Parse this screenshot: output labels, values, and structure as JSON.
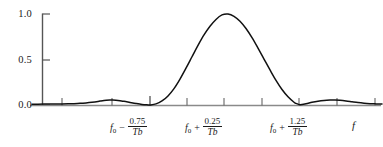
{
  "chart_data": {
    "type": "line",
    "title": "",
    "subtitle": "",
    "xlabel": "f",
    "ylabel": "",
    "ylim": [
      0.0,
      1.0
    ],
    "grid": false,
    "legend": null,
    "y_ticks": [
      "1.0",
      "0.5",
      "0.0"
    ],
    "y_tick_values": [
      1.0,
      0.5,
      0.0
    ],
    "x_tick_count": 8,
    "x_tick_labels": [
      {
        "id": "tick-minus-0p75",
        "base": "f",
        "base_sub": "0",
        "operator": "−",
        "numerator": "0.75",
        "denominator": "T",
        "denominator_sub": "b"
      },
      {
        "id": "tick-plus-0p25",
        "base": "f",
        "base_sub": "0",
        "operator": "+",
        "numerator": "0.25",
        "denominator": "T",
        "denominator_sub": "b"
      },
      {
        "id": "tick-plus-1p25",
        "base": "f",
        "base_sub": "0",
        "operator": "+",
        "numerator": "1.25",
        "denominator": "T",
        "denominator_sub": "b"
      }
    ],
    "series": [
      {
        "name": "spectrum",
        "color": "#111111",
        "x": [
          32,
          38,
          44,
          50,
          56,
          62,
          68,
          74,
          80,
          86,
          92,
          98,
          100,
          104,
          110,
          112,
          118,
          124,
          130,
          136,
          142,
          148,
          150,
          156,
          162,
          168,
          174,
          180,
          186,
          192,
          198,
          204,
          210,
          216,
          222,
          228,
          234,
          240,
          246,
          252,
          258,
          264,
          270,
          276,
          282,
          288,
          294,
          296,
          300,
          306,
          312,
          318,
          324,
          330,
          335,
          340,
          346,
          352,
          358,
          364,
          370,
          376,
          382
        ],
        "y": [
          0.008,
          0.009,
          0.01,
          0.011,
          0.012,
          0.012,
          0.013,
          0.015,
          0.018,
          0.023,
          0.03,
          0.039,
          0.043,
          0.05,
          0.054,
          0.054,
          0.05,
          0.04,
          0.028,
          0.016,
          0.006,
          0.001,
          0.0,
          0.012,
          0.045,
          0.1,
          0.18,
          0.285,
          0.405,
          0.53,
          0.655,
          0.77,
          0.865,
          0.94,
          0.99,
          1.0,
          0.975,
          0.92,
          0.84,
          0.74,
          0.625,
          0.505,
          0.385,
          0.27,
          0.17,
          0.09,
          0.03,
          0.018,
          0.004,
          0.014,
          0.03,
          0.042,
          0.05,
          0.054,
          0.055,
          0.052,
          0.045,
          0.036,
          0.027,
          0.02,
          0.015,
          0.012,
          0.01
        ]
      }
    ],
    "colors": {
      "curve": "#111111",
      "axis": "#555555",
      "baseline": "#8a8a8a",
      "text": "#1a1a1a"
    }
  },
  "axes": {
    "y_axis_name": "vertical-axis",
    "x_axis_name": "horizontal-axis"
  }
}
